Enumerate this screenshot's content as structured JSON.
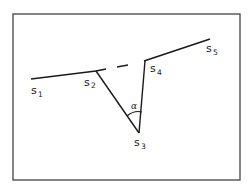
{
  "diagram": {
    "type": "polyline-with-angle",
    "colors": {
      "frame": "#444444",
      "line": "#1a1a1a",
      "background": "#ffffff"
    },
    "points": [
      {
        "id": "s1",
        "label": "s",
        "sub": "1"
      },
      {
        "id": "s2",
        "label": "s",
        "sub": "2"
      },
      {
        "id": "s3",
        "label": "s",
        "sub": "3"
      },
      {
        "id": "s4",
        "label": "s",
        "sub": "4"
      },
      {
        "id": "s5",
        "label": "s",
        "sub": "5"
      }
    ],
    "angle": {
      "label": "α",
      "at": "s3",
      "between": [
        "s2",
        "s4"
      ]
    },
    "edges": [
      {
        "from": "s1",
        "to": "s2",
        "style": "solid"
      },
      {
        "from": "s2",
        "to": "s4",
        "style": "dashed"
      },
      {
        "from": "s4",
        "to": "s5",
        "style": "solid"
      },
      {
        "from": "s2",
        "to": "s3",
        "style": "solid"
      },
      {
        "from": "s3",
        "to": "s4",
        "style": "solid"
      }
    ]
  }
}
